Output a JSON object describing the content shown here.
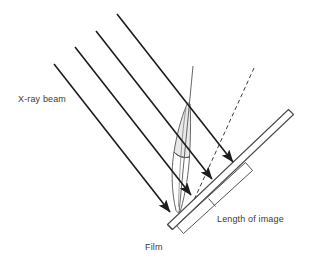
{
  "figure": {
    "title_text": "",
    "type": "technical-line-diagram",
    "background_color": "#ffffff",
    "line_color": "#1c1c1c",
    "thin_line_color": "#555555",
    "shade_color": "#e9e9e9",
    "text_color": "#3b3b3b"
  },
  "labels": {
    "xray_beam": "X-ray beam",
    "film": "Film",
    "length_of_image": "Length of image"
  },
  "elements": {
    "beam_rays": {
      "name": "x-ray-beam-rays",
      "count": 4,
      "direction_degrees": 47,
      "has_arrowheads": true,
      "rays": [
        {
          "x1": 54,
          "y1": 64,
          "x2": 172,
          "y2": 214
        },
        {
          "x1": 75,
          "y1": 47,
          "x2": 193,
          "y2": 197
        },
        {
          "x1": 96,
          "y1": 31,
          "x2": 214,
          "y2": 181
        },
        {
          "x1": 117,
          "y1": 14,
          "x2": 235,
          "y2": 164
        }
      ]
    },
    "central_axis": {
      "name": "tooth-long-axis",
      "x1": 193,
      "y1": 66,
      "x2": 179,
      "y2": 213,
      "style": "solid-thin"
    },
    "projection_line": {
      "name": "image-projection-dashed-line",
      "x1": 254,
      "y1": 68,
      "x2": 194,
      "y2": 200,
      "style": "dashed"
    },
    "tooth": {
      "name": "tooth-outline",
      "crown_shaded": true,
      "apex_point": [
        177,
        212
      ],
      "shade": "#e9e9e9"
    },
    "film": {
      "name": "film-plate",
      "from": [
        168,
        224
      ],
      "to": [
        292,
        112
      ],
      "thickness_px": 10
    },
    "image_length_bracket": {
      "name": "length-of-image-bracket",
      "from": [
        178,
        218
      ],
      "to": [
        246,
        186
      ],
      "shows_extent": true
    }
  },
  "label_positions": {
    "xray_beam": {
      "x": 18,
      "y": 102
    },
    "film": {
      "x": 145,
      "y": 250
    },
    "length_of_image": {
      "x": 217,
      "y": 222
    }
  }
}
